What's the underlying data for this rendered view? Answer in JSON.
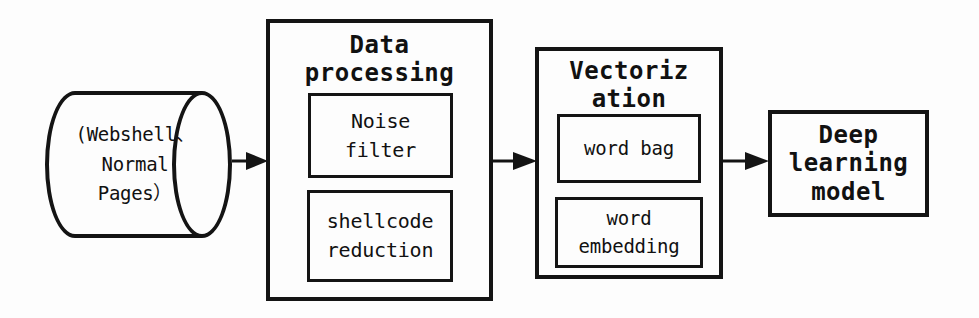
{
  "diagram": {
    "background_color": "#fdfdfd",
    "line_color": "#141414",
    "datastore": {
      "name": "input-datastore",
      "shape": "cylinder",
      "lines": [
        "(Webshell、",
        "Normal",
        "Pages）"
      ]
    },
    "stages": [
      {
        "id": "data-processing",
        "title_lines": [
          "Data",
          "processing"
        ],
        "substeps": [
          {
            "id": "noise-filter",
            "lines": [
              "Noise",
              "filter"
            ]
          },
          {
            "id": "shellcode-reduction",
            "lines": [
              "shellcode",
              "reduction"
            ]
          }
        ]
      },
      {
        "id": "vectorization",
        "title_lines": [
          "Vectoriz",
          "ation"
        ],
        "substeps": [
          {
            "id": "word-bag",
            "lines": [
              "word bag"
            ]
          },
          {
            "id": "word-embedding",
            "lines": [
              "word",
              "embedding"
            ]
          }
        ]
      },
      {
        "id": "deep-learning-model",
        "title_lines": [
          "Deep",
          "learning",
          "model"
        ],
        "substeps": []
      }
    ],
    "connectors": [
      {
        "id": "arrow-datastore-to-dataprocessing",
        "from": "input-datastore",
        "to": "data-processing",
        "direction": "right"
      },
      {
        "id": "arrow-dataprocessing-to-vectorization",
        "from": "data-processing",
        "to": "vectorization",
        "direction": "right"
      },
      {
        "id": "arrow-vectorization-to-model",
        "from": "vectorization",
        "to": "deep-learning-model",
        "direction": "right"
      }
    ]
  }
}
